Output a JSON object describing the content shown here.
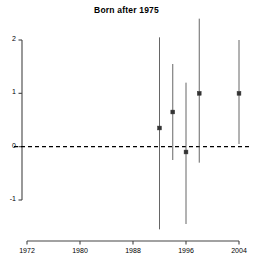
{
  "chart_data": {
    "type": "scatter",
    "title": "Born after 1975",
    "xlabel": "",
    "ylabel": "",
    "xlim": [
      1970,
      2006
    ],
    "ylim": [
      -1.75,
      2.45
    ],
    "xticks": [
      1972,
      1980,
      1988,
      1996,
      2004
    ],
    "xticklabels": [
      "1972",
      "1980",
      "1988",
      "1996",
      "2004"
    ],
    "yticks": [
      -1,
      0,
      1,
      2
    ],
    "yticklabels": [
      "-1",
      "0",
      "1",
      "2"
    ],
    "grid": false,
    "legend": null,
    "reference_line": {
      "type": "horizontal",
      "y": 0,
      "style": "dashed",
      "color": "#000000"
    },
    "x": [
      1992,
      1994,
      1996,
      1998,
      2004
    ],
    "values": [
      0.35,
      0.65,
      -0.1,
      1.0,
      1.0
    ],
    "error_low": [
      -1.55,
      -0.25,
      -1.45,
      -0.3,
      0.05
    ],
    "error_high": [
      2.05,
      1.55,
      1.2,
      2.4,
      2.0
    ],
    "series": [
      {
        "name": "estimate",
        "points": [
          {
            "x": 1992,
            "y": 0.35,
            "lo": -1.55,
            "hi": 2.05
          },
          {
            "x": 1994,
            "y": 0.65,
            "lo": -0.25,
            "hi": 1.55
          },
          {
            "x": 1996,
            "y": -0.1,
            "lo": -1.45,
            "hi": 1.2
          },
          {
            "x": 1998,
            "y": 1.0,
            "lo": -0.3,
            "hi": 2.4
          },
          {
            "x": 2004,
            "y": 1.0,
            "lo": 0.05,
            "hi": 2.0
          }
        ]
      }
    ],
    "marker": "square",
    "line_color": "#555555",
    "marker_color": "#333333",
    "axis_color": "#444444"
  }
}
